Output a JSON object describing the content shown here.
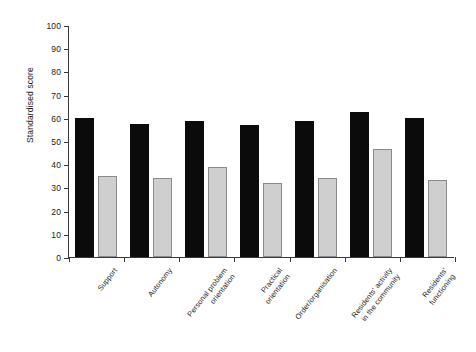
{
  "chart_data": {
    "type": "bar",
    "title": "",
    "subtitle": "",
    "xlabel": "",
    "ylabel": "Standardised score",
    "ylim": [
      0,
      100
    ],
    "ytick_step": 10,
    "yticks": [
      100,
      90,
      80,
      70,
      60,
      50,
      40,
      30,
      20,
      10,
      0
    ],
    "grid": false,
    "legend": null,
    "legend_position": "none",
    "categories": [
      "Support",
      "Autonomy",
      "Personal problem orientation",
      "Practical orientation",
      "Order/organisation",
      "Residents' activity in the community",
      "Residents' functioning"
    ],
    "category_lines": [
      [
        "Support"
      ],
      [
        "Autonomy"
      ],
      [
        "Personal problem",
        "orientation"
      ],
      [
        "Practical",
        "orientation"
      ],
      [
        "Order/organisation"
      ],
      [
        "Residents' activity",
        "in the community"
      ],
      [
        "Residents'",
        "functioning"
      ]
    ],
    "series": [
      {
        "name": "series-dark",
        "color": "#0b0b0b",
        "values": [
          60,
          57.5,
          58.5,
          57,
          58.5,
          62.5,
          60
        ]
      },
      {
        "name": "series-light",
        "color": "#cfcfcf",
        "values": [
          35,
          34,
          39,
          32,
          34,
          46.5,
          33
        ]
      }
    ]
  },
  "axis": {
    "y_title": "Standardised score"
  }
}
